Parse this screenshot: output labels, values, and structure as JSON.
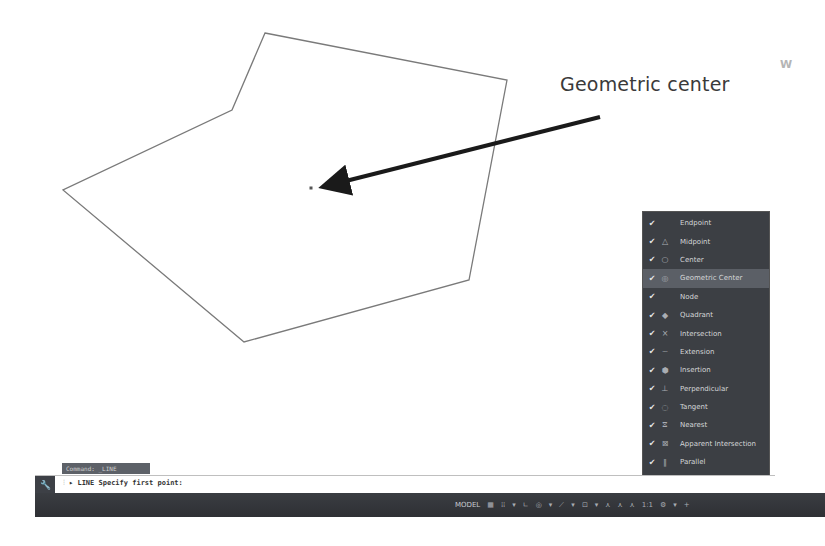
{
  "drawing": {
    "polygon_points": "265,33 507,80 469,280 244,342 63,190 232,110",
    "center_marker": {
      "x": 311,
      "y": 188
    },
    "callout_text": "Geometric center",
    "arrow": {
      "x1": 600,
      "y1": 117,
      "x2": 326,
      "y2": 186
    },
    "viewcube_label": "W"
  },
  "osnap_menu": {
    "items": [
      {
        "label": "Endpoint",
        "checked": true,
        "glyph": ""
      },
      {
        "label": "Midpoint",
        "checked": true,
        "glyph": "△"
      },
      {
        "label": "Center",
        "checked": true,
        "glyph": "○"
      },
      {
        "label": "Geometric Center",
        "checked": true,
        "glyph": "◎",
        "highlighted": true
      },
      {
        "label": "Node",
        "checked": true,
        "glyph": ""
      },
      {
        "label": "Quadrant",
        "checked": true,
        "glyph": "◆"
      },
      {
        "label": "Intersection",
        "checked": true,
        "glyph": "×"
      },
      {
        "label": "Extension",
        "checked": true,
        "glyph": "┈"
      },
      {
        "label": "Insertion",
        "checked": true,
        "glyph": "⬢"
      },
      {
        "label": "Perpendicular",
        "checked": true,
        "glyph": "⊥"
      },
      {
        "label": "Tangent",
        "checked": true,
        "glyph": "◌"
      },
      {
        "label": "Nearest",
        "checked": true,
        "glyph": "⧖"
      },
      {
        "label": "Apparent Intersection",
        "checked": true,
        "glyph": "⊠"
      },
      {
        "label": "Parallel",
        "checked": true,
        "glyph": "∥"
      }
    ],
    "settings_label": "Object Snap Settings..."
  },
  "command_line": {
    "history_tag": "Command: _LINE",
    "prompt": "LINE Specify first point:",
    "icon": "wrench-icon"
  },
  "status_bar": {
    "model_label": "MODEL",
    "icons": [
      "grid-icon",
      "snap-icon",
      "dropdown-icon",
      "ortho-icon",
      "polar-icon",
      "dropdown-icon",
      "isodraft-icon",
      "dropdown-icon",
      "osnap-icon",
      "dropdown-icon",
      "annotation-scale-icon",
      "annotation-visibility-icon",
      "annotation-auto-icon",
      "scale-label",
      "gear-icon",
      "dropdown-icon",
      "plus-icon"
    ],
    "scale_label": "1:1"
  }
}
